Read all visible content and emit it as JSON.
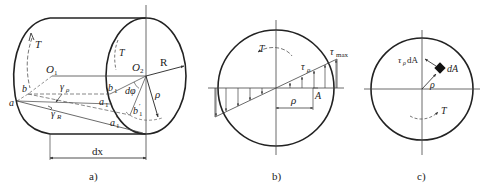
{
  "figure": {
    "panels": [
      {
        "id": "a",
        "caption": "a)",
        "labels": {
          "torque_left": "T",
          "torque_right": "T",
          "O1": "O",
          "O1_sub": "1",
          "O2": "O",
          "O2_sub": "2",
          "R": "R",
          "rho": "ρ",
          "dphi": "dφ",
          "b": "b",
          "a": "a",
          "b1": "b",
          "b1_sub": "1",
          "a1": "a",
          "a1_sub": "1",
          "b1p": "b",
          "b1p_sub": "1",
          "b1p_prime": "′",
          "a1p": "a",
          "a1p_sub": "1",
          "a1p_prime": "′",
          "gamma_rho": "γ",
          "gamma_rho_sub": "ρ",
          "gamma_R": "γ",
          "gamma_R_sub": "R",
          "dx": "dx"
        }
      },
      {
        "id": "b",
        "caption": "b)",
        "labels": {
          "torque": "T",
          "tau_max": "τ",
          "tau_max_sub": "max",
          "tau_rho": "τ",
          "tau_rho_sub": "ρ",
          "rho": "ρ",
          "A": "A"
        }
      },
      {
        "id": "c",
        "caption": "c)",
        "labels": {
          "force": "τ",
          "force_sub": "ρ",
          "force_tail": "dA",
          "dA": "dA",
          "rho": "ρ",
          "torque": "T"
        }
      }
    ],
    "colors": {
      "stroke": "#222222",
      "thin": "#444444",
      "background": "#ffffff"
    }
  }
}
